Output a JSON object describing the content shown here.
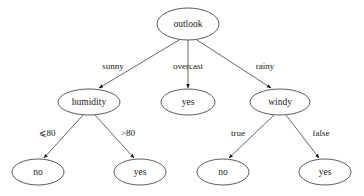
{
  "diagram": {
    "type": "decision-tree",
    "background_color": "#ffffff",
    "node_stroke_color": "#4a4a4a",
    "edge_color": "#555555",
    "text_color": "#1a1a1a",
    "nodes": [
      {
        "id": "outlook",
        "label": "outlook",
        "cx": 188,
        "cy": 24,
        "rx": 31,
        "ry": 16,
        "kind": "decision"
      },
      {
        "id": "humidity",
        "label": "humidity",
        "cx": 89,
        "cy": 102,
        "rx": 31,
        "ry": 13,
        "kind": "decision"
      },
      {
        "id": "yes_mid",
        "label": "yes",
        "cx": 188,
        "cy": 102,
        "rx": 27,
        "ry": 13,
        "kind": "leaf"
      },
      {
        "id": "windy",
        "label": "windy",
        "cx": 280,
        "cy": 102,
        "rx": 30,
        "ry": 13,
        "kind": "decision"
      },
      {
        "id": "no_1",
        "label": "no",
        "cx": 38,
        "cy": 172,
        "rx": 26,
        "ry": 13,
        "kind": "leaf"
      },
      {
        "id": "yes_2",
        "label": "yes",
        "cx": 140,
        "cy": 172,
        "rx": 26,
        "ry": 13,
        "kind": "leaf"
      },
      {
        "id": "no_3",
        "label": "no",
        "cx": 223,
        "cy": 172,
        "rx": 26,
        "ry": 13,
        "kind": "leaf"
      },
      {
        "id": "yes_4",
        "label": "yes",
        "cx": 325,
        "cy": 172,
        "rx": 26,
        "ry": 13,
        "kind": "leaf"
      }
    ],
    "edges": [
      {
        "id": "e1",
        "from": "outlook",
        "to": "humidity",
        "label": "sunny",
        "lx": 113,
        "ly": 66,
        "x1": 179,
        "y1": 40,
        "x2": 99,
        "y2": 88
      },
      {
        "id": "e2",
        "from": "outlook",
        "to": "yes_mid",
        "label": "overcast",
        "lx": 188,
        "ly": 66,
        "x1": 188,
        "y1": 40,
        "x2": 188,
        "y2": 88
      },
      {
        "id": "e3",
        "from": "outlook",
        "to": "windy",
        "label": "rainy",
        "lx": 265,
        "ly": 66,
        "x1": 197,
        "y1": 40,
        "x2": 271,
        "y2": 88
      },
      {
        "id": "e4",
        "from": "humidity",
        "to": "no_1",
        "label": "⩽80",
        "lx": 47,
        "ly": 133,
        "x1": 83,
        "y1": 115,
        "x2": 44,
        "y2": 158
      },
      {
        "id": "e5",
        "from": "humidity",
        "to": "yes_2",
        "label": ">80",
        "lx": 128,
        "ly": 133,
        "x1": 95,
        "y1": 115,
        "x2": 134,
        "y2": 158
      },
      {
        "id": "e6",
        "from": "windy",
        "to": "no_3",
        "label": "true",
        "lx": 238,
        "ly": 133,
        "x1": 274,
        "y1": 115,
        "x2": 229,
        "y2": 158
      },
      {
        "id": "e7",
        "from": "windy",
        "to": "yes_4",
        "label": "false",
        "lx": 321,
        "ly": 133,
        "x1": 286,
        "y1": 115,
        "x2": 319,
        "y2": 158
      }
    ]
  }
}
